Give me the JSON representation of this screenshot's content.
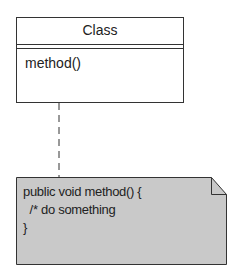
{
  "class": {
    "name": "Class",
    "methods": [
      "method()"
    ]
  },
  "note": {
    "lines": [
      "public void method() {",
      "  /* do something",
      "}"
    ]
  },
  "colors": {
    "stroke": "#333333",
    "note_fill": "#c9c9c9",
    "class_fill": "#ffffff"
  }
}
